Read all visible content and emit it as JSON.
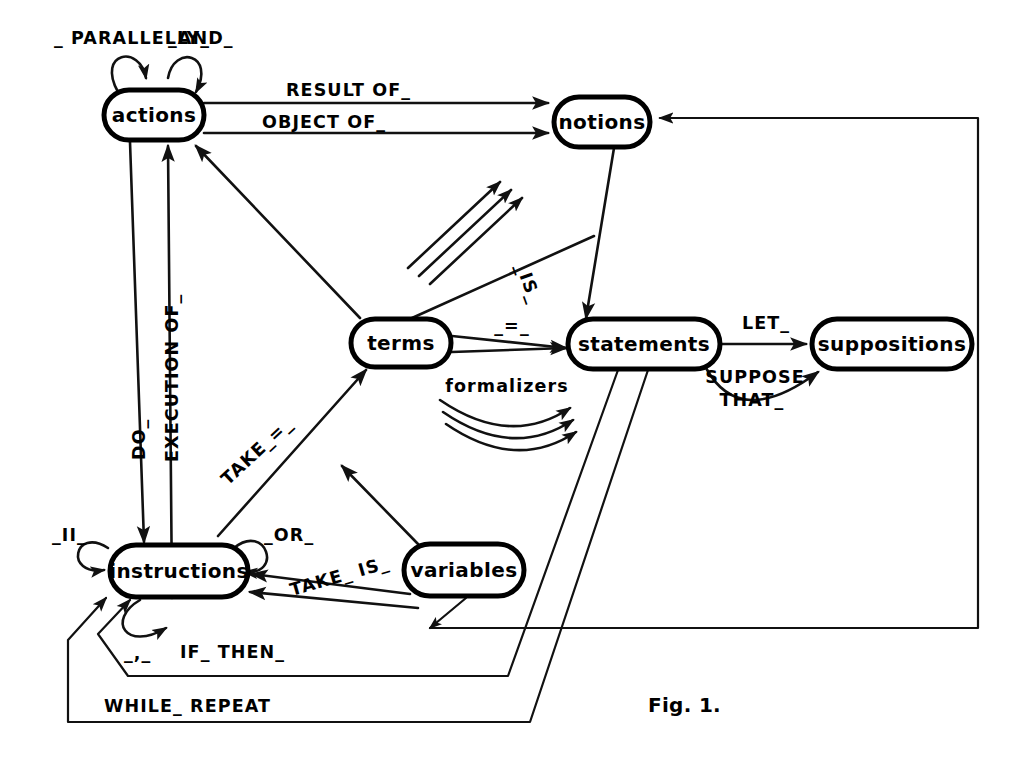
{
  "figure": {
    "caption": "Fig. 1.",
    "caption_x": 648,
    "caption_y": 712,
    "width": 1030,
    "height": 774,
    "background": "#ffffff",
    "ink_color": "#111111"
  },
  "nodes": [
    {
      "id": "actions",
      "label": "actions",
      "x": 104,
      "y": 90,
      "w": 100,
      "h": 50
    },
    {
      "id": "notions",
      "label": "notions",
      "x": 554,
      "y": 97,
      "w": 96,
      "h": 50
    },
    {
      "id": "terms",
      "label": "terms",
      "x": 351,
      "y": 319,
      "w": 100,
      "h": 48
    },
    {
      "id": "statements",
      "label": "statements",
      "x": 568,
      "y": 319,
      "w": 152,
      "h": 50
    },
    {
      "id": "suppositions",
      "label": "suppositions",
      "x": 812,
      "y": 319,
      "w": 160,
      "h": 50
    },
    {
      "id": "variables",
      "label": "variables",
      "x": 404,
      "y": 544,
      "w": 120,
      "h": 52
    },
    {
      "id": "instructions",
      "label": "instructions",
      "x": 110,
      "y": 545,
      "w": 138,
      "h": 52
    }
  ],
  "edges": [
    {
      "id": "actions-self-parallelly",
      "from": "actions",
      "to": "actions",
      "label": "_ PARALLELLY_",
      "kind": "self-loop",
      "label_x": 54,
      "label_y": 44
    },
    {
      "id": "actions-self-and",
      "from": "actions",
      "to": "actions",
      "label": "_AND_",
      "kind": "self-loop",
      "label_x": 170,
      "label_y": 44
    },
    {
      "id": "actions-notions-result",
      "from": "actions",
      "to": "notions",
      "label": "RESULT OF_",
      "kind": "straight",
      "label_x": 286,
      "label_y": 95
    },
    {
      "id": "actions-notions-object",
      "from": "actions",
      "to": "notions",
      "label": "OBJECT OF_",
      "kind": "straight",
      "label_x": 263,
      "label_y": 127
    },
    {
      "id": "actions-instructions-do",
      "from": "actions",
      "to": "instructions",
      "label": "DO_",
      "kind": "vertical",
      "label_x": 137,
      "label_y": 448
    },
    {
      "id": "instructions-actions-exec",
      "from": "instructions",
      "to": "actions",
      "label": "EXECUTION OF_",
      "kind": "vertical",
      "label_x": 169,
      "label_y": 430
    },
    {
      "id": "terms-actions",
      "from": "terms",
      "to": "actions",
      "label": "",
      "kind": "diagonal",
      "label_x": 0,
      "label_y": 0
    },
    {
      "id": "notions-statements-is",
      "from": "notions",
      "to": "statements",
      "label": "_IS_",
      "kind": "diagonal",
      "label_x": 523,
      "label_y": 262
    },
    {
      "id": "terms-statements-eq",
      "from": "terms",
      "to": "statements",
      "label": "_=_",
      "kind": "straight",
      "label_x": 512,
      "label_y": 325
    },
    {
      "id": "formalizers",
      "from": "terms",
      "to": "statements",
      "label": "formalizers",
      "kind": "curve-bundle",
      "label_x": 505,
      "label_y": 388
    },
    {
      "id": "naming-arrows",
      "from": "terms",
      "to": "notions",
      "label": "",
      "kind": "arrow-bundle",
      "label_x": 0,
      "label_y": 0
    },
    {
      "id": "statements-suppositions-let",
      "from": "statements",
      "to": "suppositions",
      "label": "LET_",
      "kind": "straight",
      "label_x": 768,
      "label_y": 325
    },
    {
      "id": "statements-suppositions-suppose",
      "from": "statements",
      "to": "suppositions",
      "label": "SUPPOSE\nTHAT_",
      "kind": "curve",
      "label_x": 753,
      "label_y": 378
    },
    {
      "id": "instructions-self-par",
      "from": "instructions",
      "to": "instructions",
      "label": "_II_",
      "kind": "self-loop",
      "label_x": 52,
      "label_y": 536
    },
    {
      "id": "instructions-self-or",
      "from": "instructions",
      "to": "instructions",
      "label": "_OR_",
      "kind": "self-loop",
      "label_x": 266,
      "label_y": 534
    },
    {
      "id": "instructions-self-comma",
      "from": "instructions",
      "to": "instructions",
      "label": "_,_",
      "kind": "self-loop",
      "label_x": 138,
      "label_y": 652
    },
    {
      "id": "instructions-terms-take-eq",
      "from": "instructions",
      "to": "terms",
      "label": "TAKE_=_",
      "kind": "diagonal",
      "label_x": 232,
      "label_y": 478
    },
    {
      "id": "variables-terms",
      "from": "variables",
      "to": "terms",
      "label": "",
      "kind": "diagonal",
      "label_x": 0,
      "label_y": 0
    },
    {
      "id": "variables-instructions-take-is",
      "from": "variables",
      "to": "instructions",
      "label": "TAKE_IS_",
      "kind": "diagonal",
      "label_x": 296,
      "label_y": 585
    },
    {
      "id": "statements-instructions-if-then",
      "from": "statements",
      "to": "instructions",
      "label": "IF_ THEN_",
      "kind": "polyline",
      "label_x": 184,
      "label_y": 652
    },
    {
      "id": "statements-instructions-while",
      "from": "statements",
      "to": "instructions",
      "label": "WHILE_ REPEAT",
      "kind": "polyline",
      "label_x": 110,
      "label_y": 707
    },
    {
      "id": "loop-back-to-notions",
      "from": "variables",
      "to": "notions",
      "label": "",
      "kind": "polyline",
      "label_x": 0,
      "label_y": 0
    }
  ],
  "labels": {
    "parallelly": "_ PARALLELLY_",
    "and": "_AND_",
    "result_of": "RESULT OF_",
    "object_of": "OBJECT OF_",
    "do": "DO_",
    "execution_of": "EXECUTION OF_",
    "is": "_IS_",
    "equals": "_=_",
    "formalizers": "formalizers",
    "let": "LET_",
    "suppose": "SUPPOSE",
    "that": "THAT_",
    "parallel_bars": "_II_",
    "or": "_OR_",
    "comma": "_,_",
    "take_eq": "TAKE_=_",
    "take_is": "TAKE_ IS_",
    "if_then": "IF_ THEN_",
    "while_repeat": "WHILE_ REPEAT"
  },
  "node_labels": {
    "actions": "actions",
    "notions": "notions",
    "terms": "terms",
    "statements": "statements",
    "suppositions": "suppositions",
    "variables": "variables",
    "instructions": "instructions"
  }
}
